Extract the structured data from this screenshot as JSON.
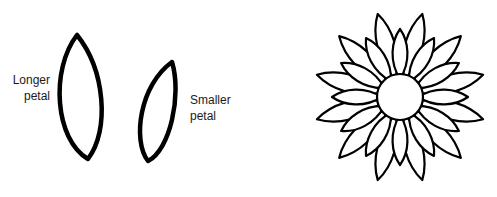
{
  "labels": {
    "longer_petal": [
      "Longer",
      "petal"
    ],
    "smaller_petal": [
      "Smaller",
      "petal"
    ]
  },
  "colors": {
    "stroke": "#000000",
    "background": "#ffffff",
    "text": "#1a1a1a"
  },
  "flower": {
    "center": [
      400,
      97
    ],
    "center_radius": 23,
    "outer_petal_count": 12,
    "inner_petal_count": 12
  }
}
